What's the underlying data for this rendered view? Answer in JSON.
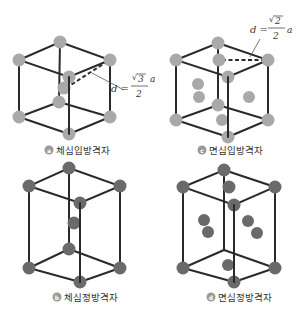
{
  "colors": {
    "edge": "#2a2a2a",
    "atom_light": "#a9a9a9",
    "atom_dark": "#6a6a6a",
    "badge": "#9a9a9a"
  },
  "panels": [
    {
      "id": "a",
      "badge": "a",
      "caption": "체심입방격자",
      "formula": {
        "lhs": "d =",
        "radicand": "3",
        "denominator": "2",
        "variable": "a"
      }
    },
    {
      "id": "c",
      "badge": "c",
      "caption": "면심입방격자",
      "formula": {
        "lhs": "d =",
        "radicand": "2",
        "denominator": "2",
        "variable": "a"
      }
    },
    {
      "id": "b",
      "badge": "b",
      "caption": "체심정방격자"
    },
    {
      "id": "d",
      "badge": "d",
      "caption": "면심정방격자"
    }
  ]
}
